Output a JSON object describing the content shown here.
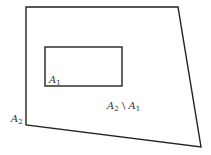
{
  "diagram": {
    "outer_set": {
      "name": "A2",
      "label_base": "A",
      "label_sub": "2",
      "points": "26,7 178,7 201,147 26,125"
    },
    "inner_set": {
      "name": "A1",
      "label_base": "A",
      "label_sub": "1",
      "x": 45,
      "y": 47,
      "width": 77,
      "height": 39
    },
    "difference_label": {
      "left_base": "A",
      "left_sub": "2",
      "operator": " \\ ",
      "right_base": "A",
      "right_sub": "1"
    },
    "colors": {
      "stroke": "#222222",
      "text": "#333333",
      "background": "#ffffff"
    }
  }
}
